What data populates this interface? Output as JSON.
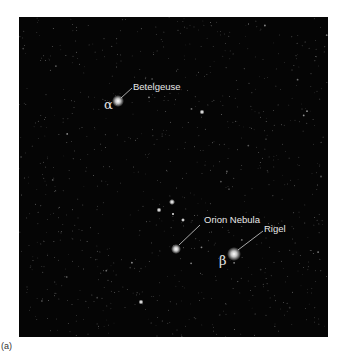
{
  "figure": {
    "caption": "(a)",
    "labels": {
      "betelgeuse": "Betelgeuse",
      "orion_nebula": "Orion Nebula",
      "rigel": "Rigel"
    },
    "greek": {
      "alpha": "α",
      "beta": "β"
    }
  }
}
